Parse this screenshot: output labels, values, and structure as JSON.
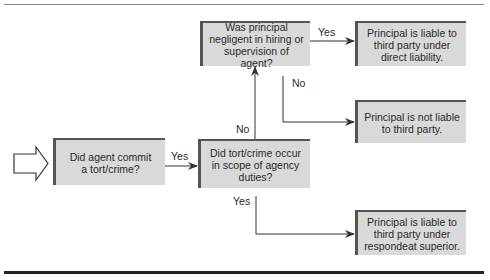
{
  "diagram": {
    "type": "flowchart",
    "nodes": {
      "start": {
        "text": "Did agent commit a tort/crime?"
      },
      "scope": {
        "text": "Did tort/crime occur in scope of agency duties?"
      },
      "negligent": {
        "text": "Was principal negligent in hiring or supervision of agent?"
      },
      "direct": {
        "text": "Principal is liable to third party under direct liability."
      },
      "not_liable": {
        "text": "Principal is not liable to third party."
      },
      "respondeat": {
        "text": "Principal is liable to third party under respondeat superior."
      }
    },
    "edges": {
      "start_to_scope": {
        "label": "Yes"
      },
      "scope_to_negligent": {
        "label": "No"
      },
      "negligent_to_direct": {
        "label": "Yes"
      },
      "negligent_to_not_liable": {
        "label": "No"
      },
      "scope_to_respondeat": {
        "label": "Yes"
      }
    },
    "colors": {
      "box_fill": "#d9d9d9",
      "box_border": "#555555",
      "line": "#333333",
      "text": "#2a2a2a"
    }
  }
}
